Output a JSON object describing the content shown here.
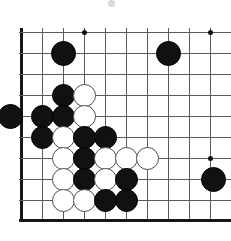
{
  "figure": {
    "kind": "go-board-diagram",
    "width_px": 231,
    "height_px": 241,
    "background_color": "#ffffff"
  },
  "board": {
    "label": "go-board",
    "view": "bottom-left corner, partial board",
    "grid": {
      "spacing_px": 21,
      "origin_x": 21,
      "origin_y": 32,
      "columns": 10,
      "rows": 10,
      "line_color": "#5a5a5a",
      "border_color": "#161616",
      "vertical_line_x": [
        21,
        42,
        63,
        84,
        105,
        126,
        147,
        168,
        189,
        210
      ],
      "horizontal_line_y": [
        32,
        53,
        74,
        95,
        116,
        137,
        158,
        179,
        200,
        220
      ],
      "left_border_x": 21,
      "bottom_border_y": 220
    },
    "star_points": [
      {
        "name": "hoshi-top-left",
        "x": 84,
        "y": 32
      },
      {
        "name": "hoshi-top-right",
        "x": 210,
        "y": 32
      },
      {
        "name": "hoshi-bottom-right",
        "x": 210,
        "y": 158
      }
    ],
    "stone_colors": {
      "black": "#111111",
      "white": "#ffffff",
      "white_outline": "#4e4e4e"
    },
    "stone_diameter_px": 21,
    "stones": [
      {
        "color": "black",
        "x": 63,
        "y": 53,
        "d": 25
      },
      {
        "color": "black",
        "x": 168,
        "y": 53,
        "d": 25
      },
      {
        "color": "black",
        "x": 63,
        "y": 95,
        "d": 23
      },
      {
        "color": "white",
        "x": 84,
        "y": 95,
        "d": 23
      },
      {
        "color": "black",
        "x": 10,
        "y": 116,
        "d": 25
      },
      {
        "color": "black",
        "x": 42,
        "y": 116,
        "d": 23
      },
      {
        "color": "black",
        "x": 63,
        "y": 116,
        "d": 23
      },
      {
        "color": "white",
        "x": 84,
        "y": 116,
        "d": 23
      },
      {
        "color": "black",
        "x": 42,
        "y": 137,
        "d": 23
      },
      {
        "color": "white",
        "x": 63,
        "y": 137,
        "d": 23
      },
      {
        "color": "black",
        "x": 84,
        "y": 137,
        "d": 23
      },
      {
        "color": "black",
        "x": 105,
        "y": 137,
        "d": 23
      },
      {
        "color": "white",
        "x": 63,
        "y": 158,
        "d": 23
      },
      {
        "color": "black",
        "x": 84,
        "y": 158,
        "d": 23
      },
      {
        "color": "white",
        "x": 105,
        "y": 158,
        "d": 23
      },
      {
        "color": "white",
        "x": 126,
        "y": 158,
        "d": 23
      },
      {
        "color": "white",
        "x": 147,
        "y": 158,
        "d": 23
      },
      {
        "color": "white",
        "x": 63,
        "y": 179,
        "d": 23
      },
      {
        "color": "black",
        "x": 84,
        "y": 179,
        "d": 23
      },
      {
        "color": "white",
        "x": 105,
        "y": 179,
        "d": 23
      },
      {
        "color": "black",
        "x": 126,
        "y": 179,
        "d": 23
      },
      {
        "color": "black",
        "x": 213,
        "y": 179,
        "d": 25
      },
      {
        "color": "white",
        "x": 63,
        "y": 200,
        "d": 23
      },
      {
        "color": "white",
        "x": 84,
        "y": 200,
        "d": 23
      },
      {
        "color": "black",
        "x": 105,
        "y": 200,
        "d": 23
      },
      {
        "color": "black",
        "x": 126,
        "y": 200,
        "d": 23
      }
    ],
    "stone_counts": {
      "black": 16,
      "white": 10,
      "total": 26
    }
  },
  "artifacts": [
    {
      "name": "scan-speck-top",
      "x": 111,
      "y": 3,
      "d": 7,
      "color": "#d8d8d8"
    }
  ]
}
